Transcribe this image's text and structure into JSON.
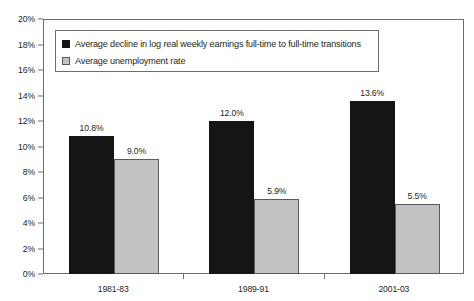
{
  "chart_data": {
    "type": "bar",
    "title": "",
    "xlabel": "",
    "ylabel": "",
    "ylim": [
      0,
      20
    ],
    "ytick_labels": [
      "0%",
      "2%",
      "4%",
      "6%",
      "8%",
      "10%",
      "12%",
      "14%",
      "16%",
      "18%",
      "20%"
    ],
    "ytick_values": [
      0,
      2,
      4,
      6,
      8,
      10,
      12,
      14,
      16,
      18,
      20
    ],
    "grid": false,
    "legend_position": "upper-left-inside",
    "categories": [
      "1981-83",
      "1989-91",
      "2001-03"
    ],
    "series": [
      {
        "name": "Average decline in log real weekly earnings full-time to full-time transitions",
        "color": "#151515",
        "values": [
          10.8,
          12.0,
          13.6
        ],
        "labels": [
          "10.8%",
          "12.0%",
          "13.6%"
        ]
      },
      {
        "name": "Average unemployment rate",
        "color": "#c2c2c2",
        "values": [
          9.0,
          5.9,
          5.5
        ],
        "labels": [
          "9.0%",
          "5.9%",
          "5.5%"
        ]
      }
    ]
  },
  "title_sliver": "",
  "legend": {
    "items": [
      {
        "label": "Average decline in log real weekly earnings full-time to full-time transitions",
        "swatch": "black-square-swatch"
      },
      {
        "label": "Average unemployment rate",
        "swatch": "gray-square-swatch"
      }
    ]
  }
}
